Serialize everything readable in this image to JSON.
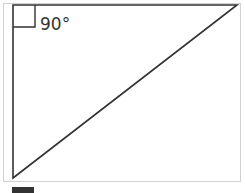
{
  "diagram": {
    "shape": "right-triangle",
    "angle_label": "90°",
    "colors": {
      "stroke": "#333333",
      "frame": "#d0d0d0",
      "background": "#ffffff"
    }
  }
}
